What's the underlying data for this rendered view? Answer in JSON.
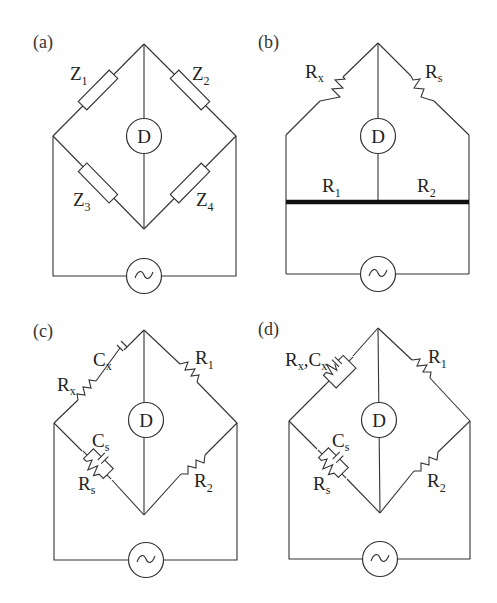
{
  "figure": {
    "panels": [
      {
        "id": "a",
        "label": "(a)",
        "detector": "D",
        "source": "~",
        "arms": {
          "top_left": {
            "name": "Z",
            "sub": "1"
          },
          "top_right": {
            "name": "Z",
            "sub": "2"
          },
          "bottom_left": {
            "name": "Z",
            "sub": "3"
          },
          "bottom_right": {
            "name": "Z",
            "sub": "4"
          }
        }
      },
      {
        "id": "b",
        "label": "(b)",
        "detector": "D",
        "source": "~",
        "arms": {
          "top_left": {
            "name": "R",
            "sub": "x"
          },
          "top_right": {
            "name": "R",
            "sub": "s"
          }
        },
        "slide_wire": {
          "left": {
            "name": "R",
            "sub": "1"
          },
          "right": {
            "name": "R",
            "sub": "2"
          }
        }
      },
      {
        "id": "c",
        "label": "(c)",
        "detector": "D",
        "source": "~",
        "arms": {
          "top_left_r": {
            "name": "R",
            "sub": "x"
          },
          "top_left_c": {
            "name": "C",
            "sub": "x"
          },
          "top_right": {
            "name": "R",
            "sub": "1"
          },
          "bottom_left_c": {
            "name": "C",
            "sub": "s"
          },
          "bottom_left_r": {
            "name": "R",
            "sub": "s"
          },
          "bottom_right": {
            "name": "R",
            "sub": "2"
          }
        }
      },
      {
        "id": "d",
        "label": "(d)",
        "detector": "D",
        "source": "~",
        "arms": {
          "top_left": {
            "name": "R",
            "sub": "x",
            "sep": ",",
            "name2": "C",
            "sub2": "x"
          },
          "top_right": {
            "name": "R",
            "sub": "1"
          },
          "bottom_left_c": {
            "name": "C",
            "sub": "s"
          },
          "bottom_left_r": {
            "name": "R",
            "sub": "s"
          },
          "bottom_right": {
            "name": "R",
            "sub": "2"
          }
        }
      }
    ]
  }
}
